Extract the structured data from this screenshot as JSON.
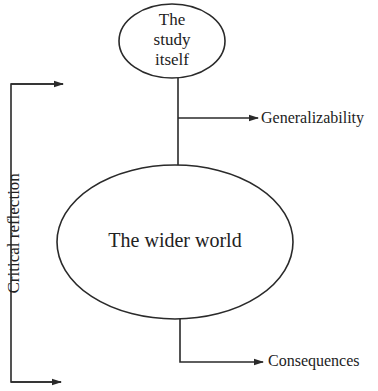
{
  "diagram": {
    "type": "flow-diagram",
    "colors": {
      "stroke": "#2a2a2a",
      "text": "#222222",
      "background": "#ffffff"
    },
    "nodes": {
      "study": {
        "label_lines": [
          "The",
          "study",
          "itself"
        ],
        "shape": "ellipse"
      },
      "world": {
        "label": "The wider world",
        "shape": "ellipse"
      }
    },
    "outputs": {
      "generalizability": "Generalizability",
      "consequences": "Consequences"
    },
    "side_bracket": {
      "label": "Critical reflection",
      "orientation": "vertical"
    },
    "edges": [
      {
        "from": "study",
        "to": "world",
        "style": "line"
      },
      {
        "from": "study-world-link",
        "to": "generalizability",
        "style": "arrow"
      },
      {
        "from": "world",
        "to": "consequences",
        "style": "arrow"
      },
      {
        "from": "side_bracket",
        "to": "study-level",
        "style": "arrow"
      },
      {
        "from": "side_bracket",
        "to": "consequences-level",
        "style": "arrow"
      }
    ]
  }
}
